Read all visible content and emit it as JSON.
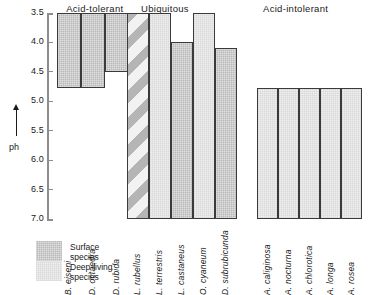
{
  "chart_data": {
    "type": "bar",
    "title": "",
    "ylabel": "ph",
    "xlabel": "",
    "ylim": [
      3.5,
      7.0
    ],
    "y_inverted": true,
    "grid": false,
    "axis_ticks": [
      "3.5",
      "4.0",
      "4.5",
      "5.0",
      "5.5",
      "6.0",
      "6.5",
      "7.0"
    ],
    "legend_position": "bottom-left",
    "legend": [
      {
        "key": "surface",
        "label_line1": "Surface",
        "label_line2": "species",
        "fill": "surface",
        "color": "#b9b9b9"
      },
      {
        "key": "deep",
        "label_line1": "Deep-living",
        "label_line2": "species",
        "fill": "deep",
        "color": "#eeeeee"
      }
    ],
    "groups": [
      {
        "name": "Acid-tolerant",
        "bars": [
          {
            "species": "B. eiseni",
            "ph_top": 3.5,
            "ph_bottom": 4.77,
            "fill": "surface"
          },
          {
            "species": "D. octaedra",
            "ph_top": 3.5,
            "ph_bottom": 4.77,
            "fill": "surface"
          },
          {
            "species": "D. rubida",
            "ph_top": 3.5,
            "ph_bottom": 4.5,
            "fill": "surface"
          }
        ]
      },
      {
        "name": "Ubiquitous",
        "bars": [
          {
            "species": "L. rubellus",
            "ph_top": 3.5,
            "ph_bottom": 7.0,
            "fill": "both"
          },
          {
            "species": "L. terrestris",
            "ph_top": 3.5,
            "ph_bottom": 7.0,
            "fill": "deep"
          },
          {
            "species": "L. castaneus",
            "ph_top": 4.0,
            "ph_bottom": 7.0,
            "fill": "surface"
          },
          {
            "species": "O. cyaneum",
            "ph_top": 3.5,
            "ph_bottom": 7.0,
            "fill": "deep"
          },
          {
            "species": "D. subrubicunda",
            "ph_top": 4.1,
            "ph_bottom": 7.0,
            "fill": "surface"
          }
        ]
      },
      {
        "name": "Acid-intolerant",
        "bars": [
          {
            "species": "A. caliginosa",
            "ph_top": 4.77,
            "ph_bottom": 7.0,
            "fill": "deep"
          },
          {
            "species": "A. nocturna",
            "ph_top": 4.77,
            "ph_bottom": 7.0,
            "fill": "deep"
          },
          {
            "species": "A. chlorotica",
            "ph_top": 4.77,
            "ph_bottom": 7.0,
            "fill": "deep"
          },
          {
            "species": "A. longa",
            "ph_top": 4.77,
            "ph_bottom": 7.0,
            "fill": "deep"
          },
          {
            "species": "A. rosea",
            "ph_top": 4.77,
            "ph_bottom": 7.0,
            "fill": "deep"
          }
        ]
      }
    ]
  }
}
